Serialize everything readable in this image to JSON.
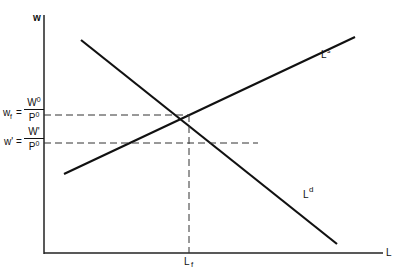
{
  "diagram": {
    "axes": {
      "y_label": "w",
      "x_label": "L"
    },
    "curves": {
      "supply": {
        "label": "L",
        "superscript": "s"
      },
      "demand": {
        "label": "L",
        "superscript": "d"
      }
    },
    "equilibrium": {
      "x_label": "L",
      "x_label_sub": "f",
      "wage_label_prefix": "w",
      "wage_label_sub": "f",
      "wage_eq": "=",
      "wage_num": "W",
      "wage_num_sup": "0",
      "wage_den": "P",
      "wage_den_sup": "0"
    },
    "lower_wage": {
      "prefix": "w'",
      "eq": "=",
      "num": "W'",
      "den": "P",
      "den_sup": "0"
    },
    "colors": {
      "line": "#111111",
      "background": "#ffffff"
    }
  }
}
